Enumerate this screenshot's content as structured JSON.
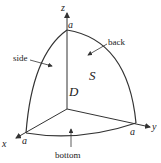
{
  "diagram": {
    "axes": {
      "x_label": "x",
      "y_label": "y",
      "z_label": "z"
    },
    "intercepts": {
      "x": "a",
      "y": "a",
      "z": "a"
    },
    "region_label": "D",
    "surface_label": "S",
    "faces": {
      "side": "side",
      "back": "back",
      "bottom": "bottom"
    },
    "colors": {
      "stroke": "#333333",
      "text": "#222222",
      "background": "#ffffff"
    }
  }
}
